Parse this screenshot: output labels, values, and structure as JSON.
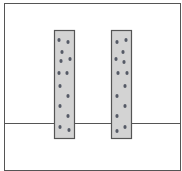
{
  "diagram": {
    "colors": {
      "background": "#ffffff",
      "stroke": "#555555",
      "pillar_fill": "#d3d3d3",
      "dot": "#555a66"
    },
    "outer_box": {
      "x": 4,
      "y": 3,
      "width": 176,
      "height": 167
    },
    "horizontal_line": {
      "y": 123,
      "x1": 4,
      "x2": 180
    },
    "pillars": [
      {
        "name": "left-pillar",
        "x": 54,
        "y": 30,
        "width": 20,
        "height": 108,
        "dots": [
          [
            59,
            40
          ],
          [
            68,
            42
          ],
          [
            62,
            52
          ],
          [
            61,
            61
          ],
          [
            70,
            59
          ],
          [
            59,
            73
          ],
          [
            67,
            73
          ],
          [
            60,
            86
          ],
          [
            68,
            96
          ],
          [
            60,
            106
          ],
          [
            68,
            116
          ],
          [
            60,
            127
          ],
          [
            69,
            130
          ]
        ]
      },
      {
        "name": "right-pillar",
        "x": 111,
        "y": 30,
        "width": 20,
        "height": 108,
        "dots": [
          [
            117,
            42
          ],
          [
            126,
            40
          ],
          [
            123,
            52
          ],
          [
            116,
            59
          ],
          [
            124,
            62
          ],
          [
            118,
            73
          ],
          [
            127,
            73
          ],
          [
            125,
            86
          ],
          [
            117,
            96
          ],
          [
            125,
            106
          ],
          [
            117,
            116
          ],
          [
            125,
            127
          ],
          [
            117,
            131
          ]
        ]
      }
    ]
  }
}
